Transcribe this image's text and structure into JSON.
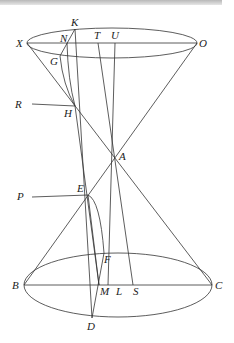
{
  "figure": {
    "type": "geometric diagram of a double cone",
    "labels": {
      "K": "K",
      "N": "N",
      "X": "X",
      "T": "T",
      "U": "U",
      "O": "O",
      "G": "G",
      "R": "R",
      "H": "H",
      "A": "A",
      "P": "P",
      "E": "E",
      "F": "F",
      "B": "B",
      "M": "M",
      "L": "L",
      "S": "S",
      "C": "C",
      "D": "D"
    },
    "colors": {
      "line": "#333333",
      "text": "#222222",
      "topbar": "#c0c0c0"
    }
  }
}
